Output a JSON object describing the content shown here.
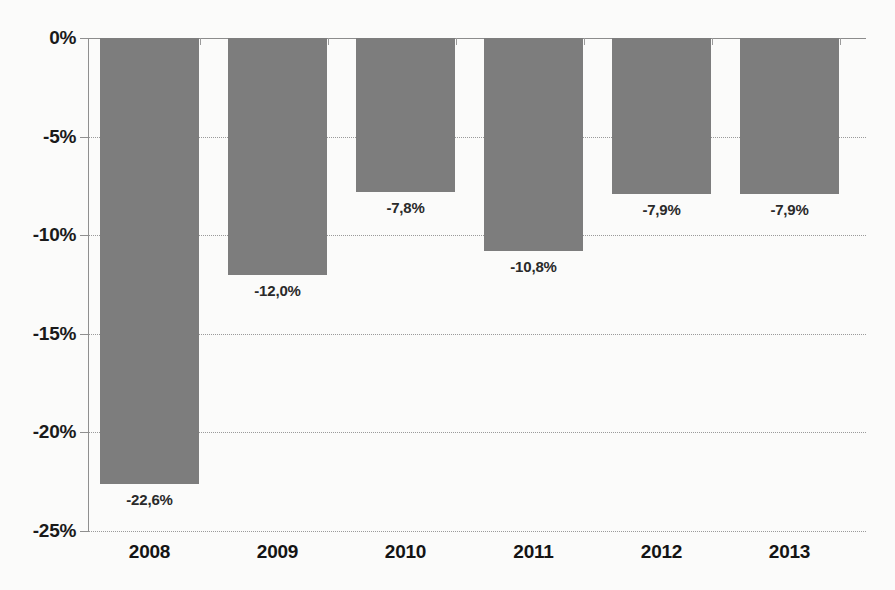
{
  "chart_data": {
    "type": "bar",
    "title": "",
    "subtitle": "",
    "xlabel": "",
    "ylabel": "",
    "categories": [
      "2008",
      "2009",
      "2010",
      "2011",
      "2012",
      "2013"
    ],
    "values": [
      -22.6,
      -12.0,
      -7.8,
      -10.8,
      -7.9,
      -7.9
    ],
    "data_labels": [
      "-22,6%",
      "-12,0%",
      "-7,8%",
      "-10,8%",
      "-7,9%",
      "-7,9%"
    ],
    "ylim": [
      -25,
      0
    ],
    "ytick_values": [
      0,
      -5,
      -10,
      -15,
      -20,
      -25
    ],
    "ytick_labels": [
      "0%",
      "-5%",
      "-10%",
      "-15%",
      "-20%",
      "-25%"
    ],
    "grid": true,
    "grid_style": "dotted",
    "legend": null,
    "legend_position": "none",
    "series": [
      {
        "name": "",
        "values": [
          -22.6,
          -12.0,
          -7.8,
          -10.8,
          -7.9,
          -7.9
        ],
        "color": "#7d7d7d"
      }
    ],
    "colors": {
      "bar": "#7d7d7d",
      "axis": "#8f8f8f",
      "grid": "#9a9a9a",
      "text": "#1a1a1a",
      "background": "#fbfbfa"
    }
  }
}
